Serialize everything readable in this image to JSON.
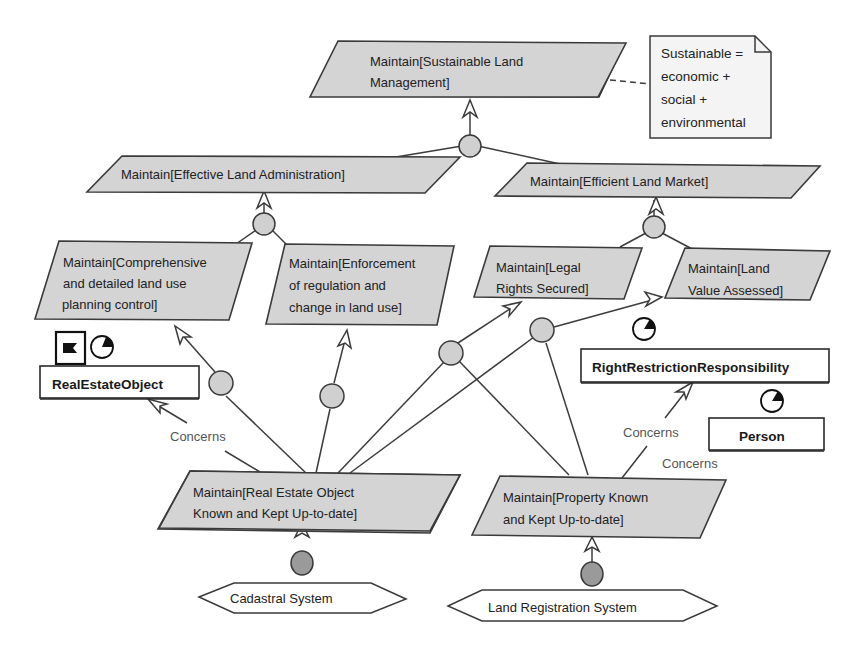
{
  "diagram": {
    "type": "KAOS goal model",
    "goals": [
      {
        "id": "g1",
        "lines": [
          "Maintain[Sustainable Land",
          "Management]"
        ]
      },
      {
        "id": "g2",
        "lines": [
          "Maintain[Effective Land Administration]"
        ]
      },
      {
        "id": "g3",
        "lines": [
          "Maintain[Efficient Land Market]"
        ]
      },
      {
        "id": "g4",
        "lines": [
          "Maintain[Comprehensive",
          " and detailed land use",
          "planning control]"
        ]
      },
      {
        "id": "g5",
        "lines": [
          "Maintain[Enforcement",
          " of regulation and",
          "change in land use]"
        ]
      },
      {
        "id": "g6",
        "lines": [
          "Maintain[Legal",
          "Rights Secured]"
        ]
      },
      {
        "id": "g7",
        "lines": [
          "Maintain[Land",
          "Value Assessed]"
        ]
      },
      {
        "id": "g8",
        "lines": [
          "Maintain[Real Estate Object",
          "Known and Kept Up-to-date]"
        ]
      },
      {
        "id": "g9",
        "lines": [
          "Maintain[Property Known",
          "and Kept Up-to-date]"
        ]
      }
    ],
    "note": {
      "lines": [
        "Sustainable =",
        "economic +",
        "social +",
        "environmental"
      ]
    },
    "entities": [
      {
        "id": "e1",
        "label": "RealEstateObject"
      },
      {
        "id": "e2",
        "label": "RightRestrictionResponsibility"
      },
      {
        "id": "e3",
        "label": "Person"
      }
    ],
    "agents": [
      {
        "id": "a1",
        "label": "Cadastral System"
      },
      {
        "id": "a2",
        "label": "Land Registration System"
      }
    ],
    "relation_labels": {
      "concerns_1": "Concerns",
      "concerns_2": "Concerns",
      "concerns_3": "Concerns"
    },
    "colors": {
      "goal_fill": "#d4d4d4",
      "refinement_fill": "#d0d0d0",
      "agent_dot_fill": "#9a9a9a",
      "stroke": "#3a3a3a",
      "background": "#ffffff"
    }
  }
}
